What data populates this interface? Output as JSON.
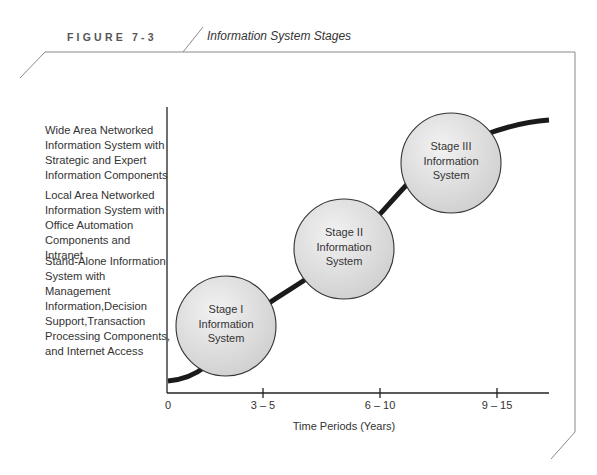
{
  "figure": {
    "number": "FIGURE 7-3",
    "title": "Information System Stages"
  },
  "y_labels": [
    {
      "text": "Wide Area Networked\nInformation System with\nStrategic and Expert\nInformation Components"
    },
    {
      "text": "Local Area Networked\nInformation System with\nOffice Automation\nComponents and Intranet"
    },
    {
      "text": "Stand-Alone Information\nSystem with Management\nInformation,Decision\nSupport,Transaction\nProcessing Components,\nand Internet Access"
    }
  ],
  "stages": [
    {
      "label": "Stage I\nInformation\nSystem"
    },
    {
      "label": "Stage II\nInformation\nSystem"
    },
    {
      "label": "Stage III\nInformation\nSystem"
    }
  ],
  "x_axis": {
    "ticks": [
      "0",
      "3 – 5",
      "6 – 10",
      "9 – 15"
    ],
    "title": "Time Periods (Years)"
  },
  "colors": {
    "curve": "#1a1a1a",
    "circle_fill": "#e2e2e2",
    "frame": "#8a8a8a"
  }
}
